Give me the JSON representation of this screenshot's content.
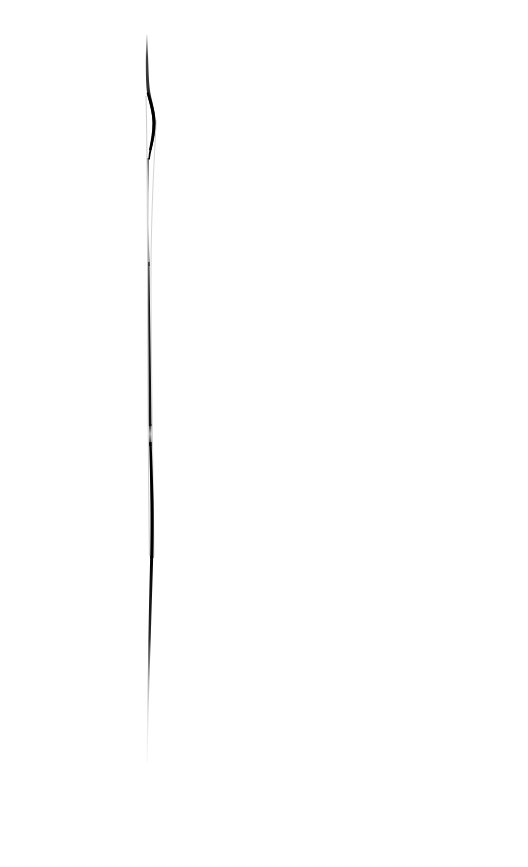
{
  "image": {
    "kind": "scanned-ink-stroke",
    "title": "Vertical ink stroke on blank page",
    "width": 528,
    "height": 867,
    "background_color": "#ffffff",
    "ink_color": "#111111",
    "faint_ink_color": "#b8b8b8",
    "description": "A single near-vertical hand-drawn ink stroke on an otherwise blank white page. The stroke tapers from a faint hairline at top, bulges into a solid black S-curve near the top, thins almost to nothing in the upper-middle, re-thickens through the middle, then tapers and fades into a pale grey hairline that ends abruptly in the lower third."
  },
  "stroke": {
    "name": "ink-stroke",
    "orientation": "vertical",
    "top_y": 35,
    "bottom_y": 762,
    "x_center_top": 148,
    "x_center_bottom": 147,
    "max_width_px": 5,
    "min_width_px": 1,
    "segments": [
      {
        "label": "top-hairline",
        "y_start": 35,
        "y_end": 88,
        "x_center": 148.5,
        "width": 1.6,
        "opacity": 0.85,
        "color": "#1a1a1a"
      },
      {
        "label": "upper-bulge-s-curve",
        "y_start": 88,
        "y_end": 158,
        "x_center": 152,
        "width": 4.6,
        "opacity": 1,
        "color": "#000000"
      },
      {
        "label": "upper-thin-fade",
        "y_start": 158,
        "y_end": 262,
        "x_center": 149.5,
        "width": 1.2,
        "opacity": 0.35,
        "color": "#555555"
      },
      {
        "label": "middle-rebuild",
        "y_start": 262,
        "y_end": 424,
        "x_center": 150.5,
        "width": 2.3,
        "opacity": 0.95,
        "color": "#0d0d0d"
      },
      {
        "label": "mid-notch",
        "y_start": 424,
        "y_end": 444,
        "x_center": 150,
        "width": 1.4,
        "opacity": 0.55,
        "color": "#3a3a3a"
      },
      {
        "label": "lower-thick-body",
        "y_start": 444,
        "y_end": 556,
        "x_center": 152,
        "width": 3.4,
        "opacity": 1,
        "color": "#000000"
      },
      {
        "label": "taper",
        "y_start": 556,
        "y_end": 636,
        "x_center": 151,
        "width": 2,
        "opacity": 0.92,
        "color": "#101010"
      },
      {
        "label": "grey-fade",
        "y_start": 636,
        "y_end": 702,
        "x_center": 149.5,
        "width": 1.4,
        "opacity": 0.45,
        "color": "#777777"
      },
      {
        "label": "pale-tail",
        "y_start": 702,
        "y_end": 762,
        "x_center": 147.5,
        "width": 1.1,
        "opacity": 0.22,
        "color": "#b0b0b0"
      }
    ]
  },
  "blank_regions": {
    "left_margin_label": "blank white margin left of stroke",
    "right_field_label": "blank white field right of stroke",
    "bottom_field_label": "blank white field below stroke"
  }
}
